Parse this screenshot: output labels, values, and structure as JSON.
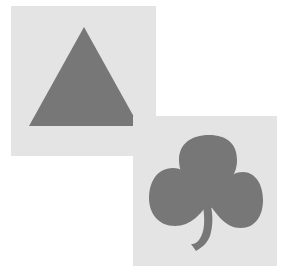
{
  "scene": {
    "background_color": "#ffffff",
    "cards": [
      {
        "name": "triangle-card",
        "card_color": "#e4e4e4",
        "shape": "triangle-icon",
        "shape_color": "#777777"
      },
      {
        "name": "shamrock-card",
        "card_color": "#e4e4e4",
        "shape": "shamrock-icon",
        "shape_color": "#777777"
      }
    ]
  }
}
